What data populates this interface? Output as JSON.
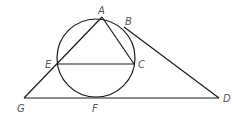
{
  "diagram": {
    "stroke_color": "#1a1a1a",
    "label_color": "#555555",
    "circle": {
      "cx": 96,
      "cy": 58,
      "r": 39
    },
    "points": {
      "A": {
        "x": 102,
        "y": 17,
        "label": "A",
        "lx": 98,
        "ly": 14
      },
      "B": {
        "x": 124,
        "y": 27,
        "label": "B",
        "lx": 125,
        "ly": 25
      },
      "C": {
        "x": 134,
        "y": 64,
        "label": "C",
        "lx": 138,
        "ly": 68
      },
      "E": {
        "x": 58,
        "y": 64,
        "label": "E",
        "lx": 45,
        "ly": 68
      },
      "G": {
        "x": 24,
        "y": 98,
        "label": "G",
        "lx": 17,
        "ly": 112
      },
      "F": {
        "x": 96,
        "y": 98,
        "label": "F",
        "lx": 92,
        "ly": 112
      },
      "D": {
        "x": 219,
        "y": 98,
        "label": "D",
        "lx": 223,
        "ly": 102
      }
    }
  }
}
